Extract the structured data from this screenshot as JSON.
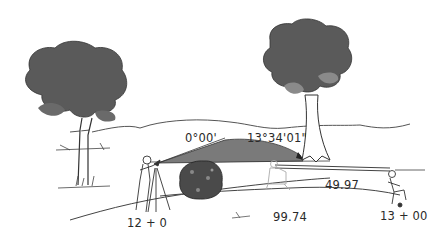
{
  "figure": {
    "colors": {
      "foliage": "#5a5a5a",
      "foliage_light": "#8a8a8a",
      "angle_wedge": "#7a7a7a",
      "rock": "#4a4a4a",
      "line": "#3a3a3a",
      "text": "#2a2a2a"
    }
  },
  "labels": {
    "backsight_angle": "0°00'",
    "foresight_angle": "13°34'01\"",
    "start_station": "12 + 0",
    "end_station": "13 + 00",
    "distance_1": "99.74",
    "distance_2": "49.97"
  },
  "elements": {
    "tree_left": "tree",
    "tree_right": "tree",
    "surveyor_instrument": "surveyor with transit on tripod",
    "surveyor_middle": "surveyor kneeling (faded)",
    "surveyor_right": "surveyor crouching at stake",
    "rock": "boulder",
    "angle_wedge": "angle arc"
  }
}
